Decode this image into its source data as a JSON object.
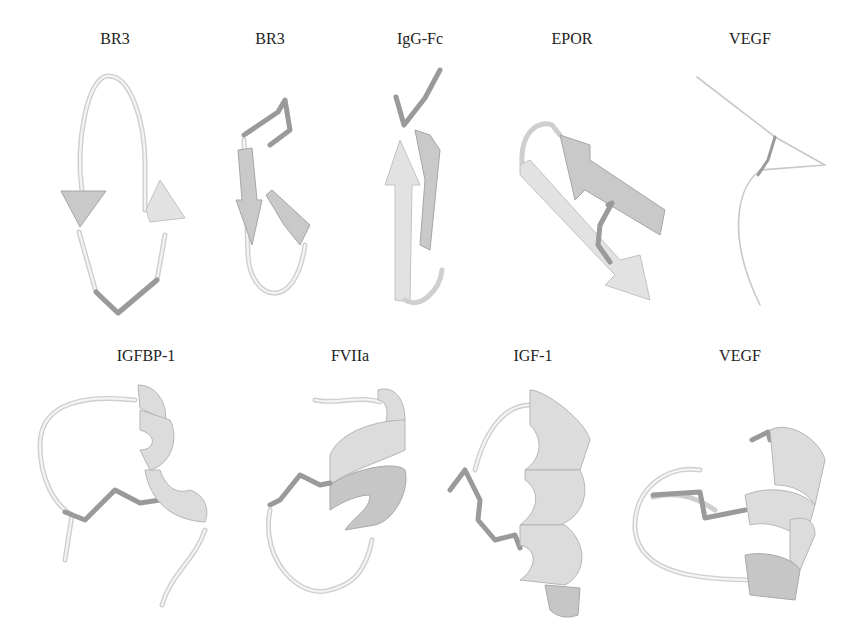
{
  "figure": {
    "rows": [
      {
        "row": "beta-hairpin / loop peptides",
        "panels": [
          {
            "label": "BR3"
          },
          {
            "label": "BR3"
          },
          {
            "label": "IgG-Fc"
          },
          {
            "label": "EPOR"
          },
          {
            "label": "VEGF"
          }
        ]
      },
      {
        "row": "helical peptides",
        "panels": [
          {
            "label": "IGFBP-1"
          },
          {
            "label": "FVIIa"
          },
          {
            "label": "IGF-1"
          },
          {
            "label": "VEGF"
          }
        ]
      }
    ],
    "colors": {
      "background": "#ffffff",
      "ribbon": "#d4d4d4",
      "disulfide": "#9a9a9a",
      "text": "#222222"
    }
  }
}
